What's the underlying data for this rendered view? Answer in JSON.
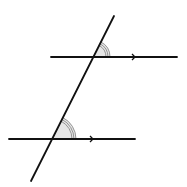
{
  "diagram": {
    "colors": {
      "line": "#111111",
      "arc": "#8a8a8a",
      "fill": "#e6e6e6",
      "background": "#ffffff"
    },
    "transversal": {
      "x1": 31,
      "y1": 181,
      "x2": 114,
      "y2": 16
    },
    "parallel_lines": [
      {
        "id": "upper",
        "x1": 51,
        "y1": 57,
        "x2": 177,
        "y2": 57,
        "arrow_x": 135
      },
      {
        "id": "lower",
        "x1": 9,
        "y1": 139,
        "x2": 135,
        "y2": 139,
        "arrow_x": 93
      }
    ],
    "angles": [
      {
        "id": "upper-angle",
        "cx": 93,
        "cy": 57,
        "radii": [
          13,
          15,
          17
        ],
        "start_deg": 0,
        "end_deg": 63.3,
        "marker": "triple-arc"
      },
      {
        "id": "lower-angle",
        "cx": 52,
        "cy": 139,
        "radii": [
          20,
          22,
          24
        ],
        "start_deg": 0,
        "end_deg": 63.3,
        "marker": "triple-arc"
      }
    ]
  }
}
